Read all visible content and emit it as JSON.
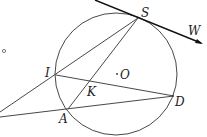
{
  "diagram": {
    "type": "geometry",
    "circle": {
      "label": "O",
      "center_label": "· O"
    },
    "points": {
      "S": "S",
      "W": "W",
      "I": "I",
      "K": "K",
      "D": "D",
      "A": "A",
      "O": "O"
    },
    "segments": [
      "SI",
      "SA",
      "ID",
      "A-left",
      "I-left",
      "tangent SW"
    ],
    "small_marker": "°"
  }
}
